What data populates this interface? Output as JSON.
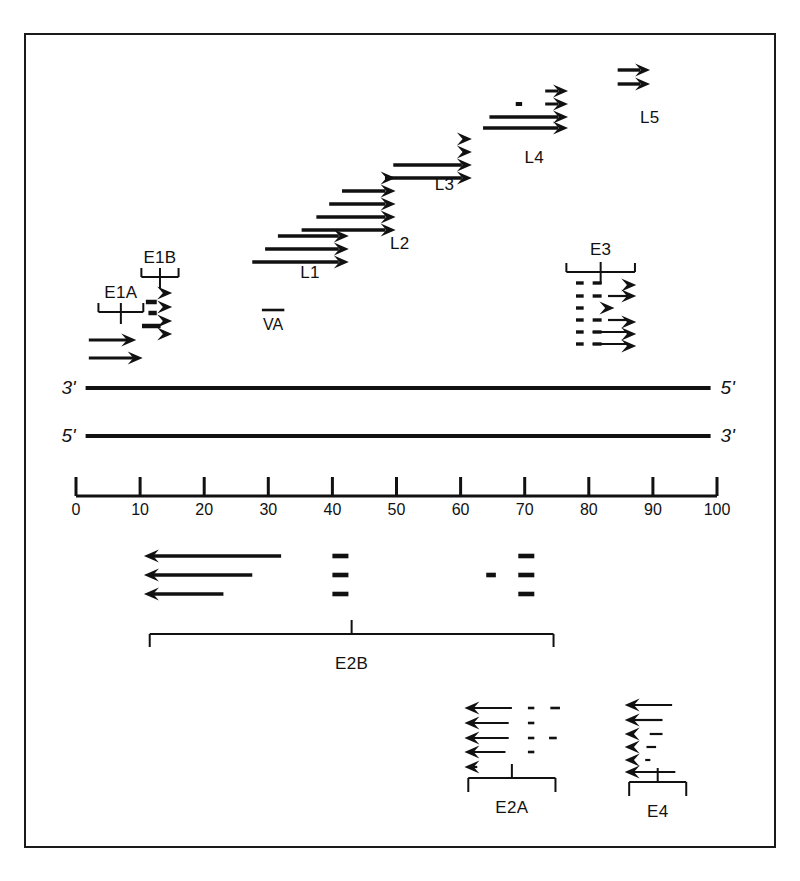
{
  "figure": {
    "type": "genome-transcription-map",
    "background": "#ffffff",
    "border_color": "#1a1a1a",
    "ink_color": "#111111"
  },
  "genome": {
    "strand_top": {
      "left_label": "3'",
      "right_label": "5'"
    },
    "strand_bottom": {
      "left_label": "5'",
      "right_label": "3'"
    }
  },
  "scale": {
    "ticks": [
      "0",
      "10",
      "20",
      "30",
      "40",
      "50",
      "60",
      "70",
      "80",
      "90",
      "100"
    ],
    "min": 0,
    "max": 100,
    "units_label": ""
  },
  "rightward_groups": [
    {
      "name": "E1A",
      "label": "E1A",
      "direction": "right",
      "bracket": {
        "start": 3.5,
        "end": 10.5
      },
      "transcripts": [
        {
          "start": 2.0,
          "end": 8.0
        },
        {
          "start": 2.0,
          "end": 9.0
        }
      ]
    },
    {
      "name": "E1B",
      "label": "E1B",
      "direction": "right",
      "bracket": {
        "start": 10.2,
        "end": 16.0
      },
      "transcripts": [
        {
          "start": 12.0,
          "end": 13.4,
          "dashes": []
        },
        {
          "start": 11.3,
          "end": 13.4,
          "dashes": []
        },
        {
          "start": 11.0,
          "end": 13.4,
          "dashes": []
        },
        {
          "start": 10.5,
          "end": 13.6,
          "dashes": []
        }
      ]
    },
    {
      "name": "VA",
      "label": "VA",
      "direction": "none",
      "transcripts": [
        {
          "start": 29.0,
          "end": 32.5
        }
      ]
    },
    {
      "name": "L1",
      "label": "L1",
      "direction": "right",
      "transcripts": [
        {
          "start": 31.5,
          "end": 41.0
        },
        {
          "start": 29.5,
          "end": 41.0
        },
        {
          "start": 27.5,
          "end": 41.0
        }
      ]
    },
    {
      "name": "L2",
      "label": "L2",
      "direction": "right",
      "transcripts": [
        {
          "start": 46.2,
          "end": 47.8
        },
        {
          "start": 41.5,
          "end": 48.2
        },
        {
          "start": 39.5,
          "end": 48.2
        },
        {
          "start": 37.5,
          "end": 48.4
        },
        {
          "start": 35.2,
          "end": 48.6
        }
      ]
    },
    {
      "name": "L3",
      "label": "L3",
      "direction": "right",
      "transcripts": [
        {
          "start": 58.0,
          "end": 60.0
        },
        {
          "start": 58.0,
          "end": 60.0
        },
        {
          "start": 49.5,
          "end": 60.2
        },
        {
          "start": 48.2,
          "end": 60.4
        }
      ]
    },
    {
      "name": "L4",
      "label": "L4",
      "direction": "right",
      "transcripts": [
        {
          "start": 70.0,
          "end": 75.0
        },
        {
          "start": 68.5,
          "end": 75.0,
          "dashes": [
            [
              68.6,
              69.4
            ]
          ]
        },
        {
          "start": 64.5,
          "end": 75.2
        },
        {
          "start": 63.5,
          "end": 75.4
        }
      ]
    },
    {
      "name": "L5",
      "label": "L5",
      "direction": "right",
      "transcripts": [
        {
          "start": 84.5,
          "end": 88.0
        },
        {
          "start": 84.5,
          "end": 88.0
        }
      ]
    }
  ],
  "leftward_groups": [
    {
      "name": "E3",
      "label": "E3",
      "direction": "right",
      "bracket": {
        "start": 76.5,
        "end": 87.0
      },
      "transcripts": [
        {
          "start": 78.0,
          "end": 86.0,
          "style": "dashed"
        },
        {
          "start": 78.0,
          "end": 86.0,
          "style": "dashed"
        },
        {
          "start": 78.0,
          "end": 84.0,
          "style": "dashed"
        },
        {
          "start": 78.0,
          "end": 86.0,
          "style": "dashed"
        },
        {
          "start": 78.0,
          "end": 86.2,
          "style": "dashed-solid"
        },
        {
          "start": 78.0,
          "end": 86.2,
          "style": "dashed-solid"
        }
      ]
    },
    {
      "name": "E2B",
      "label": "E2B",
      "direction": "left",
      "bracket": {
        "start": 12.0,
        "end": 68.0
      },
      "transcripts": [
        {
          "start": 12.0,
          "end": 32.0,
          "dashes": [
            [
              40.0,
              42.5
            ],
            [
              69.0,
              71.5
            ]
          ]
        },
        {
          "start": 12.0,
          "end": 27.5,
          "dashes": [
            [
              40.0,
              42.5
            ],
            [
              64.0,
              65.5
            ],
            [
              69.0,
              71.5
            ]
          ]
        },
        {
          "start": 12.0,
          "end": 23.0,
          "dashes": [
            [
              40.0,
              42.5
            ],
            [
              69.0,
              71.5
            ]
          ]
        }
      ]
    },
    {
      "name": "E2A",
      "label": "E2A",
      "direction": "left",
      "bracket": {
        "start": 61.5,
        "end": 74.5
      },
      "transcripts": [
        {
          "start": 62.0,
          "end": 68.0,
          "dashes": [
            [
              70.5,
              71.5
            ],
            [
              74.0,
              75.5
            ]
          ]
        },
        {
          "start": 62.0,
          "end": 67.5,
          "dashes": [
            [
              70.5,
              71.5
            ]
          ]
        },
        {
          "start": 62.0,
          "end": 67.5,
          "dashes": [
            [
              70.5,
              71.5
            ],
            [
              73.8,
              75.0
            ]
          ]
        },
        {
          "start": 62.0,
          "end": 67.0,
          "dashes": [
            [
              70.5,
              71.5
            ]
          ]
        },
        {
          "start": 62.0,
          "end": 62.6,
          "dashes": []
        }
      ]
    },
    {
      "name": "E4",
      "label": "E4",
      "direction": "left",
      "bracket": {
        "start": 86.5,
        "end": 95.0
      },
      "transcripts": [
        {
          "start": 87.0,
          "end": 93.0
        },
        {
          "start": 87.0,
          "end": 91.5
        },
        {
          "start": 89.5,
          "end": 91.5
        },
        {
          "start": 89.0,
          "end": 90.5
        },
        {
          "start": 88.8,
          "end": 89.6
        },
        {
          "start": 87.0,
          "end": 93.5
        }
      ]
    }
  ]
}
